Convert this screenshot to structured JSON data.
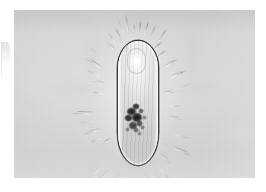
{
  "image": {
    "kind": "photomicrograph",
    "subject": "ciliate protozoan",
    "technique": "brightfield / phase-contrast light microscopy",
    "orientation": "vertical, anterior at top",
    "alt_text": "Grayscale photomicrograph of an elongated oval ciliate protozoan with a dark pellicle outline, granular cytoplasm, a bright anterior vacuole and a dense dark cluster of food granules in the lower half, surrounded by a fringe of radiating cilia."
  },
  "plate": {
    "background_color": "#d3d3d1",
    "page_color": "#ffffff",
    "left_margin_px": 14,
    "top_margin_px": 10,
    "width_px": 241,
    "height_px": 168
  },
  "organism": {
    "outline_color": "#222220",
    "body_fill_color": "#dcdcda",
    "highlight_color": "#fafaf8",
    "granule_color": "#141412",
    "cilia_count": 54,
    "body": {
      "left_px": 104,
      "top_px": 31,
      "width_px": 40,
      "height_px": 124,
      "shape": "elongated oval, rounded at both ends"
    },
    "features": [
      {
        "name": "anterior-vacuole",
        "label": "bright anterior vacuole"
      },
      {
        "name": "granule-cluster",
        "label": "dark food-granule cluster"
      },
      {
        "name": "cilia-fringe",
        "label": "radiating ciliary fringe"
      },
      {
        "name": "pellicle-outline",
        "label": "dark pellicle outline"
      },
      {
        "name": "cytoplasm",
        "label": "granular cytoplasm"
      }
    ]
  },
  "granule_cluster": {
    "blobs": [
      {
        "x": 2,
        "y": 4,
        "w": 11,
        "h": 9,
        "o": 0.95
      },
      {
        "x": 8,
        "y": 0,
        "w": 8,
        "h": 7,
        "o": 0.85
      },
      {
        "x": 0,
        "y": 11,
        "w": 9,
        "h": 8,
        "o": 0.9
      },
      {
        "x": 7,
        "y": 9,
        "w": 12,
        "h": 11,
        "o": 1.0
      },
      {
        "x": 14,
        "y": 5,
        "w": 6,
        "h": 6,
        "o": 0.6
      },
      {
        "x": 4,
        "y": 18,
        "w": 10,
        "h": 9,
        "o": 0.8
      },
      {
        "x": 12,
        "y": 17,
        "w": 7,
        "h": 7,
        "o": 0.7
      },
      {
        "x": 9,
        "y": 24,
        "w": 6,
        "h": 6,
        "o": 0.55
      },
      {
        "x": 16,
        "y": 22,
        "w": 5,
        "h": 5,
        "o": 0.45
      },
      {
        "x": 1,
        "y": 24,
        "w": 5,
        "h": 5,
        "o": 0.4
      },
      {
        "x": 13,
        "y": 28,
        "w": 5,
        "h": 5,
        "o": 0.35
      },
      {
        "x": 18,
        "y": 12,
        "w": 5,
        "h": 5,
        "o": 0.4
      }
    ]
  },
  "cilia": {
    "angles_deg": [
      -90,
      -82,
      -74,
      -66,
      -58,
      -50,
      -42,
      -34,
      -26,
      -18,
      -10,
      -2,
      6,
      14,
      22,
      30,
      38,
      46,
      54,
      62,
      70,
      78,
      86,
      94,
      102,
      110,
      118,
      126,
      134,
      142,
      150,
      158,
      166,
      174,
      182,
      190,
      198,
      206,
      214,
      222,
      230,
      238,
      246,
      254,
      262,
      270,
      278,
      286,
      294,
      302,
      310,
      318,
      326,
      334
    ]
  }
}
